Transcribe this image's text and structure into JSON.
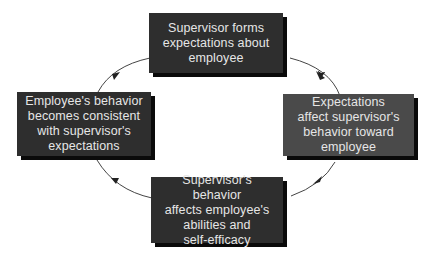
{
  "diagram": {
    "type": "cycle",
    "title": "",
    "colors": {
      "box_dark": "#2e2e2e",
      "box_mid": "#4a4a4a",
      "shadow": "#0a0a0a",
      "text": "#e6e6e6",
      "arrow": "#333333",
      "background": "#ffffff"
    },
    "nodes": [
      {
        "id": "top",
        "label": "Supervisor forms\nexpectations about\nemployee"
      },
      {
        "id": "right",
        "label": "Expectations\naffect supervisor's\nbehavior toward\nemployee"
      },
      {
        "id": "bottom",
        "label": "Supervisor's behavior\naffects employee's\nabilities and\nself-efficacy"
      },
      {
        "id": "left",
        "label": "Employee's behavior\nbecomes consistent\nwith supervisor's\nexpectations"
      }
    ],
    "edges": [
      {
        "from": "top",
        "to": "right",
        "direction": "clockwise"
      },
      {
        "from": "right",
        "to": "bottom",
        "direction": "clockwise"
      },
      {
        "from": "bottom",
        "to": "left",
        "direction": "clockwise"
      },
      {
        "from": "left",
        "to": "top",
        "direction": "clockwise"
      }
    ]
  }
}
